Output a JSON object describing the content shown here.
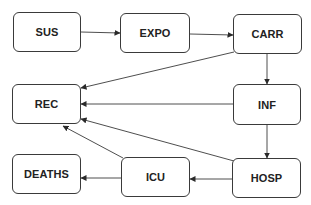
{
  "diagram": {
    "title": "",
    "colors": {
      "line": "#3a3a3a",
      "text": "#222222",
      "background": "#ffffff"
    },
    "nodes": [
      {
        "id": "sus",
        "label": "SUS",
        "x": 13,
        "y": 12,
        "w": 68,
        "h": 40
      },
      {
        "id": "expo",
        "label": "EXPO",
        "x": 120,
        "y": 13,
        "w": 70,
        "h": 40
      },
      {
        "id": "carr",
        "label": "CARR",
        "x": 233,
        "y": 14,
        "w": 69,
        "h": 40
      },
      {
        "id": "rec",
        "label": "REC",
        "x": 12,
        "y": 84,
        "w": 69,
        "h": 40
      },
      {
        "id": "inf",
        "label": "INF",
        "x": 233,
        "y": 84,
        "w": 68,
        "h": 41
      },
      {
        "id": "deaths",
        "label": "DEATHS",
        "x": 12,
        "y": 154,
        "w": 69,
        "h": 40
      },
      {
        "id": "icu",
        "label": "ICU",
        "x": 121,
        "y": 157,
        "w": 69,
        "h": 40
      },
      {
        "id": "hosp",
        "label": "HOSP",
        "x": 232,
        "y": 158,
        "w": 69,
        "h": 40
      }
    ],
    "edges": [
      {
        "from": "sus",
        "to": "expo",
        "x1": 81,
        "y1": 32,
        "x2": 120,
        "y2": 33
      },
      {
        "from": "expo",
        "to": "carr",
        "x1": 190,
        "y1": 34,
        "x2": 233,
        "y2": 35
      },
      {
        "from": "carr",
        "to": "inf",
        "x1": 267,
        "y1": 54,
        "x2": 267,
        "y2": 84
      },
      {
        "from": "carr",
        "to": "rec",
        "x1": 234,
        "y1": 52,
        "x2": 81,
        "y2": 88
      },
      {
        "from": "inf",
        "to": "rec",
        "x1": 233,
        "y1": 104,
        "x2": 81,
        "y2": 104
      },
      {
        "from": "inf",
        "to": "hosp",
        "x1": 267,
        "y1": 125,
        "x2": 267,
        "y2": 158
      },
      {
        "from": "hosp",
        "to": "rec",
        "x1": 234,
        "y1": 161,
        "x2": 81,
        "y2": 119
      },
      {
        "from": "hosp",
        "to": "icu",
        "x1": 232,
        "y1": 179,
        "x2": 190,
        "y2": 179
      },
      {
        "from": "icu",
        "to": "rec",
        "x1": 123,
        "y1": 158,
        "x2": 63,
        "y2": 126
      },
      {
        "from": "icu",
        "to": "deaths",
        "x1": 121,
        "y1": 178,
        "x2": 81,
        "y2": 178
      }
    ]
  }
}
